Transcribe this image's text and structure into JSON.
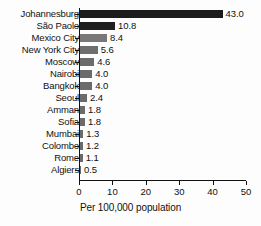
{
  "chart_data": {
    "type": "bar",
    "orientation": "horizontal",
    "title": "",
    "xlabel": "Per 100,000 population",
    "ylabel": "",
    "xlim": [
      0,
      50
    ],
    "xticks": [
      "0",
      "10",
      "20",
      "30",
      "40",
      "50"
    ],
    "grid": false,
    "legend": null,
    "categories": [
      "Johannesburg",
      "São Paolo",
      "Mexico City",
      "New York City",
      "Moscow",
      "Nairobi",
      "Bangkok",
      "Seoul",
      "Amman",
      "Sofia",
      "Mumbai",
      "Colombo",
      "Rome",
      "Algiers"
    ],
    "values": [
      43.0,
      10.8,
      8.4,
      5.6,
      4.6,
      4.0,
      4.0,
      2.4,
      1.8,
      1.8,
      1.3,
      1.2,
      1.1,
      0.5
    ],
    "value_labels": [
      "43.0",
      "10.8",
      "8.4",
      "5.6",
      "4.6",
      "4.0",
      "4.0",
      "2.4",
      "1.8",
      "1.8",
      "1.3",
      "1.2",
      "1.1",
      "0.5"
    ],
    "bar_colors": [
      "#1c1c1c",
      "#1f1f1f",
      "#787878",
      "#6e6e6e",
      "#6b6b6b",
      "#6b6b6b",
      "#6b6b6b",
      "#6b6b6b",
      "#6b6b6b",
      "#6b6b6b",
      "#6b6b6b",
      "#6b6b6b",
      "#6b6b6b",
      "#6b6b6b"
    ],
    "axis_color": "#111111",
    "background_color": "#fdfdfd"
  }
}
